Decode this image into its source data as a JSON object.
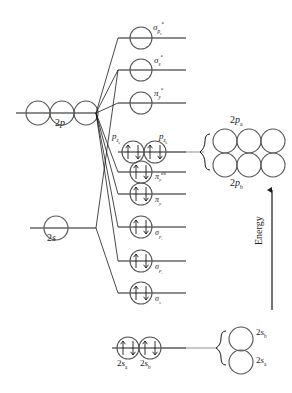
{
  "diagram": {
    "axis": {
      "energy_label": "Energy",
      "direction": "up"
    },
    "atomic_levels": [
      {
        "name": "2p-atomic",
        "label": "2p",
        "label_base": "2",
        "label_italic": "p",
        "y": 113,
        "orbital_count": 3
      },
      {
        "name": "2s-atomic",
        "label": "2s",
        "label_base": "2",
        "label_italic": "s",
        "y": 228,
        "orbital_count": 1
      }
    ],
    "molecular_levels": [
      {
        "id": "sigma-px-star",
        "base": "σ",
        "sub": "p",
        "subsub": "x",
        "sup": "*",
        "y": 38,
        "electrons": 0,
        "circles": 1
      },
      {
        "id": "sigma-s-star",
        "base": "σ",
        "sub": "s",
        "subsub": "",
        "sup": "*",
        "y": 70,
        "electrons": 0,
        "circles": 1
      },
      {
        "id": "pi-y-star",
        "base": "π",
        "sub": "y",
        "subsub": "",
        "sup": "*",
        "y": 103,
        "electrons": 0,
        "circles": 1
      },
      {
        "id": "pz-nonbonding",
        "base": "",
        "sub": "",
        "subsub": "",
        "sup": "",
        "y": 152,
        "electrons": 4,
        "circles": 2
      },
      {
        "id": "pi-y-nb",
        "base": "π",
        "sub": "y",
        "subsub": "",
        "sup": "nb",
        "y": 172,
        "electrons": 2,
        "circles": 1
      },
      {
        "id": "pi-y",
        "base": "π",
        "sub": "y",
        "subsub": "",
        "sup": "",
        "y": 194,
        "electrons": 2,
        "circles": 1
      },
      {
        "id": "sigma-px",
        "base": "σ",
        "sub": "p",
        "subsub": "x",
        "sup": "",
        "y": 227,
        "electrons": 2,
        "circles": 1
      },
      {
        "id": "sigma-pz",
        "base": "σ",
        "sub": "p",
        "subsub": "z",
        "sup": "",
        "y": 261,
        "electrons": 2,
        "circles": 1
      },
      {
        "id": "sigma-s",
        "base": "σ",
        "sub": "s",
        "subsub": "",
        "sup": "",
        "y": 293,
        "electrons": 2,
        "circles": 1
      }
    ],
    "inline_labels": {
      "pza": {
        "text": "p",
        "sub": "z",
        "subsub": "a"
      },
      "pzb": {
        "text": "p",
        "sub": "z",
        "subsub": "b"
      },
      "twosa": {
        "text": "2s",
        "sub": "a"
      },
      "twosb": {
        "text": "2s",
        "sub": "b"
      }
    },
    "bottom_level": {
      "id": "2s-sigma-pair",
      "y": 348,
      "circles": 2,
      "electrons": 4
    },
    "right_groups": [
      {
        "id": "2p-block",
        "top_label": {
          "base": "2",
          "italic": "p",
          "sub": "a"
        },
        "bottom_label": {
          "base": "2",
          "italic": "p",
          "sub": "b"
        },
        "rows": 2,
        "cols": 3,
        "x": 206,
        "y": 133
      },
      {
        "id": "2s-block",
        "top_label": {
          "base": "2",
          "italic": "s",
          "sub": "b"
        },
        "bottom_label": {
          "base": "2",
          "italic": "s",
          "sub": "a"
        },
        "rows": 2,
        "cols": 1,
        "x": 222,
        "y": 332
      }
    ],
    "colors": {
      "line": "#1a1a1a",
      "circle_stroke": "#555555",
      "text": "#1a1a1a",
      "background": "#ffffff"
    }
  }
}
